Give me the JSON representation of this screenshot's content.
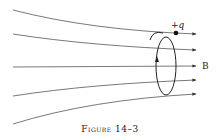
{
  "figure": {
    "caption": "Figure 14–3",
    "charge_label": "+q",
    "field_label": "B",
    "colors": {
      "line": "#333333",
      "background": "#ffffff"
    }
  },
  "field_lines": [
    {
      "start": [
        13,
        10
      ],
      "end": [
        199,
        34
      ]
    },
    {
      "start": [
        13,
        34
      ],
      "end": [
        199,
        50
      ]
    },
    {
      "start": [
        13,
        67
      ],
      "end": [
        199,
        66
      ]
    },
    {
      "start": [
        13,
        96
      ],
      "end": [
        199,
        80
      ]
    },
    {
      "start": [
        13,
        124
      ],
      "end": [
        199,
        94
      ]
    }
  ],
  "orbit": {
    "center": [
      166,
      66
    ],
    "rx": 10,
    "ry": 29
  },
  "charge": {
    "position": [
      176,
      33
    ]
  }
}
